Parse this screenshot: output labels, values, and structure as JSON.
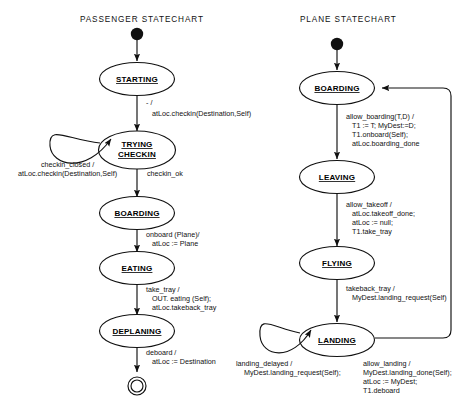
{
  "diagram": {
    "charts": [
      {
        "title": "PASSENGER  STATECHART",
        "states": [
          "STARTING",
          "TRYING CHECKIN",
          "BOARDING",
          "EATING",
          "DEPLANING"
        ],
        "initial_node": "filled-circle",
        "final_node": "double-circle",
        "transitions": [
          {
            "from": "initial",
            "to": "STARTING",
            "label": ""
          },
          {
            "from": "STARTING",
            "to": "TRYING CHECKIN",
            "label": "- /\natLoc.checkin(Destination,Self)"
          },
          {
            "from": "TRYING CHECKIN",
            "to": "TRYING CHECKIN",
            "label": "checkin_closed /\natLoc.checkin(Destination,Self)"
          },
          {
            "from": "TRYING CHECKIN",
            "to": "BOARDING",
            "label": "checkin_ok"
          },
          {
            "from": "BOARDING",
            "to": "EATING",
            "label": "onboard (Plane)/\natLoc := Plane"
          },
          {
            "from": "EATING",
            "to": "DEPLANING",
            "label": "take_tray /\nOUT. eating (Self);\natLoc.takeback_tray"
          },
          {
            "from": "DEPLANING",
            "to": "final",
            "label": "deboard /\natLoc := Destination"
          }
        ]
      },
      {
        "title": "PLANE  STATECHART",
        "states": [
          "BOARDING",
          "LEAVING",
          "FLYING",
          "LANDING"
        ],
        "initial_node": "filled-circle",
        "transitions": [
          {
            "from": "initial",
            "to": "BOARDING",
            "label": ""
          },
          {
            "from": "BOARDING",
            "to": "LEAVING",
            "label": "allow_boarding(T,D) /\nT1 := T;  MyDest:=D;\nT1.onboard(Self);\natLoc.boarding_done"
          },
          {
            "from": "LEAVING",
            "to": "FLYING",
            "label": "allow_takeoff /\natLoc.takeoff_done;\natLoc := null;\nT1.take_tray"
          },
          {
            "from": "FLYING",
            "to": "LANDING",
            "label": "takeback_tray /\nMyDest.landing_request(Self)"
          },
          {
            "from": "LANDING",
            "to": "LANDING",
            "label": "landing_delayed /\nMyDest.landing_request(Self);"
          },
          {
            "from": "LANDING",
            "to": "BOARDING",
            "label": "allow_landing /\nMyDest.landing_done(Self);\natLoc := MyDest;\nT1.deboard"
          }
        ]
      }
    ],
    "labels": {
      "p_t1_l1": "- /",
      "p_t1_l2": "atLoc.checkin(Destination,Self)",
      "p_t2_l1": "checkin_closed /",
      "p_t2_l2": "atLoc.checkin(Destination,Self)",
      "p_t3": "checkin_ok",
      "p_t4_l1": "onboard (Plane)/",
      "p_t4_l2": "atLoc := Plane",
      "p_t5_l1": "take_tray /",
      "p_t5_l2": "OUT. eating (Self);",
      "p_t5_l3": "atLoc.takeback_tray",
      "p_t6_l1": "deboard /",
      "p_t6_l2": "atLoc := Destination",
      "n_t1_l1": "allow_boarding(T,D) /",
      "n_t1_l2": "T1 := T;  MyDest:=D;",
      "n_t1_l3": "T1.onboard(Self);",
      "n_t1_l4": "atLoc.boarding_done",
      "n_t2_l1": "allow_takeoff /",
      "n_t2_l2": "atLoc.takeoff_done;",
      "n_t2_l3": "atLoc := null;",
      "n_t2_l4": "T1.take_tray",
      "n_t3_l1": "takeback_tray /",
      "n_t3_l2": "MyDest.landing_request(Self)",
      "n_t4_l1": "landing_delayed /",
      "n_t4_l2": "MyDest.landing_request(Self);",
      "n_t5_l1": "allow_landing  /",
      "n_t5_l2": "MyDest.landing_done(Self);",
      "n_t5_l3": "atLoc := MyDest;",
      "n_t5_l4": "T1.deboard"
    },
    "states_text": {
      "p0": "STARTING",
      "p1a": "TRYING",
      "p1b": "CHECKIN",
      "p2": "BOARDING",
      "p3": "EATING",
      "p4": "DEPLANING",
      "n0": "BOARDING",
      "n1": "LEAVING",
      "n2": "FLYING",
      "n3": "LANDING"
    },
    "colors": {
      "stroke": "#111111",
      "fill": "#ffffff",
      "text": "#111111"
    }
  }
}
